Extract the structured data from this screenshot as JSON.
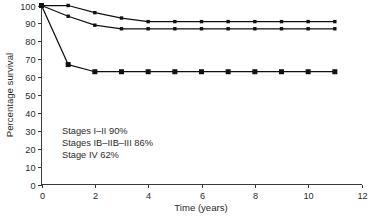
{
  "chart_data": {
    "type": "line",
    "title": "",
    "subtitle": "",
    "xlabel": "Time (years)",
    "ylabel": "Percentage survival",
    "xlim": [
      0,
      12
    ],
    "ylim": [
      0,
      100
    ],
    "xticks": [
      0,
      2,
      4,
      6,
      8,
      10,
      12
    ],
    "xtick_labels": [
      "0",
      "2",
      "4",
      "6",
      "8",
      "10",
      "12"
    ],
    "yticks": [
      0,
      10,
      20,
      30,
      40,
      50,
      60,
      70,
      80,
      90,
      100
    ],
    "ytick_labels": [
      "0",
      "10",
      "20",
      "30",
      "40",
      "50",
      "60",
      "70",
      "80",
      "90",
      "100"
    ],
    "grid": false,
    "legend_position": "none",
    "x": [
      0,
      1,
      2,
      3,
      4,
      5,
      6,
      7,
      8,
      9,
      10,
      11
    ],
    "series": [
      {
        "name": "Stages I-II",
        "marker": "square-small",
        "color": "#111111",
        "values": [
          100,
          100,
          96,
          93,
          91,
          91,
          91,
          91,
          91,
          91,
          91,
          91
        ]
      },
      {
        "name": "Stages IB-IIB-III",
        "marker": "square-small",
        "color": "#111111",
        "values": [
          100,
          94,
          89,
          87,
          87,
          87,
          87,
          87,
          87,
          87,
          87,
          87
        ]
      },
      {
        "name": "Stage IV",
        "marker": "square-large",
        "color": "#111111",
        "values": [
          100,
          67,
          63,
          63,
          63,
          63,
          63,
          63,
          63,
          63,
          63,
          63
        ]
      }
    ],
    "annotations": [
      "Stages I–II 90%",
      "Stages IB–IIB–III 86%",
      "Stage IV 62%"
    ]
  }
}
